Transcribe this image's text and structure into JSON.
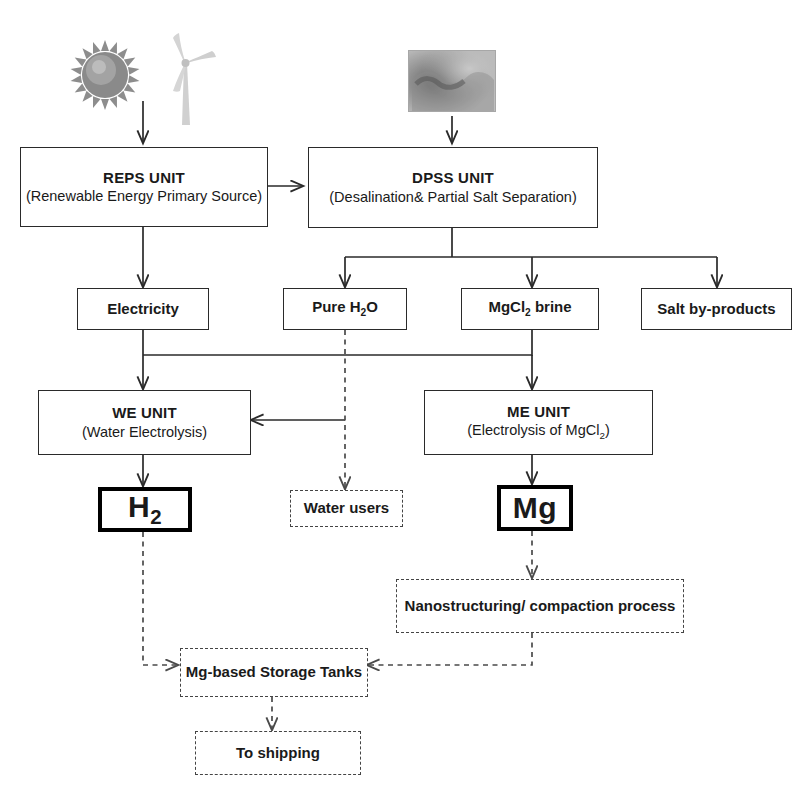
{
  "diagram": {
    "colors": {
      "line": "#2a2a2a",
      "dashed_line": "#4a4a4a",
      "box_border": "#2a2a2a",
      "thick_border": "#000000",
      "text": "#1a1a1a",
      "background": "#ffffff",
      "sun": "#8c8c8c",
      "turbine": "#cfcfcf",
      "sea": "#9a9a9a"
    },
    "icons": [
      {
        "name": "sun-icon",
        "label": "Sun (solar energy source)"
      },
      {
        "name": "wind-turbine-icon",
        "label": "Wind turbine (wind energy source)"
      },
      {
        "name": "seawater-photo",
        "label": "Seawater photo (feed water source)"
      }
    ],
    "nodes": [
      {
        "id": "reps",
        "name": "reps-unit",
        "title": "REPS UNIT",
        "sub": "(Renewable  Energy  Primary Source)",
        "style": "solid"
      },
      {
        "id": "dpss",
        "name": "dpss-unit",
        "title": "DPSS UNIT",
        "sub": "(Desalination&  Partial Salt Separation)",
        "style": "solid"
      },
      {
        "id": "electricity",
        "name": "electricity-box",
        "title": "Electricity",
        "style": "solid"
      },
      {
        "id": "pure_water",
        "name": "pure-water-box",
        "title": "Pure H2O",
        "title_html": "Pure H<sub>2</sub>O",
        "style": "solid"
      },
      {
        "id": "mgcl2",
        "name": "mgcl2-brine-box",
        "title": "MgCl2 brine",
        "title_html": "MgCl<sub>2</sub> brine",
        "style": "solid"
      },
      {
        "id": "salt",
        "name": "salt-byproducts-box",
        "title": "Salt by-products",
        "style": "solid"
      },
      {
        "id": "we",
        "name": "we-unit",
        "title": "WE UNIT",
        "sub": "(Water Electrolysis)",
        "style": "solid"
      },
      {
        "id": "me",
        "name": "me-unit",
        "title": "ME UNIT",
        "sub": "(Electrolysis of MgCl2)",
        "sub_html": "(Electrolysis of MgCl<sub>2</sub>)",
        "style": "solid"
      },
      {
        "id": "h2",
        "name": "hydrogen-product-box",
        "title": "H2",
        "title_html": "H<sub>2</sub>",
        "style": "thick"
      },
      {
        "id": "water_users",
        "name": "water-users-box",
        "title": "Water users",
        "style": "dashed"
      },
      {
        "id": "mg",
        "name": "magnesium-product-box",
        "title": "Mg",
        "style": "thick"
      },
      {
        "id": "nano",
        "name": "nanostructuring-box",
        "title": "Nanostructuring/  compaction process",
        "style": "dashed"
      },
      {
        "id": "tanks",
        "name": "mg-storage-tanks-box",
        "title": "Mg-based Storage Tanks",
        "style": "dashed"
      },
      {
        "id": "shipping",
        "name": "to-shipping-box",
        "title": "To shipping",
        "style": "dashed"
      }
    ],
    "edges": [
      {
        "from": "sun-icon",
        "to": "reps",
        "style": "solid"
      },
      {
        "from": "seawater-photo",
        "to": "dpss",
        "style": "solid"
      },
      {
        "from": "reps",
        "to": "dpss",
        "style": "solid"
      },
      {
        "from": "reps",
        "to": "electricity",
        "style": "solid"
      },
      {
        "from": "dpss",
        "to": "pure_water",
        "style": "solid"
      },
      {
        "from": "dpss",
        "to": "mgcl2",
        "style": "solid"
      },
      {
        "from": "dpss",
        "to": "salt",
        "style": "solid"
      },
      {
        "from": "electricity",
        "to": "we",
        "style": "solid"
      },
      {
        "from": "electricity",
        "to": "me",
        "style": "solid"
      },
      {
        "from": "pure_water",
        "to": "we",
        "style": "solid"
      },
      {
        "from": "pure_water",
        "to": "water_users",
        "style": "dashed"
      },
      {
        "from": "mgcl2",
        "to": "me",
        "style": "solid"
      },
      {
        "from": "we",
        "to": "h2",
        "style": "solid"
      },
      {
        "from": "me",
        "to": "mg",
        "style": "solid"
      },
      {
        "from": "mg",
        "to": "nano",
        "style": "dashed"
      },
      {
        "from": "nano",
        "to": "tanks",
        "style": "dashed"
      },
      {
        "from": "h2",
        "to": "tanks",
        "style": "dashed"
      },
      {
        "from": "tanks",
        "to": "shipping",
        "style": "dashed"
      }
    ]
  }
}
